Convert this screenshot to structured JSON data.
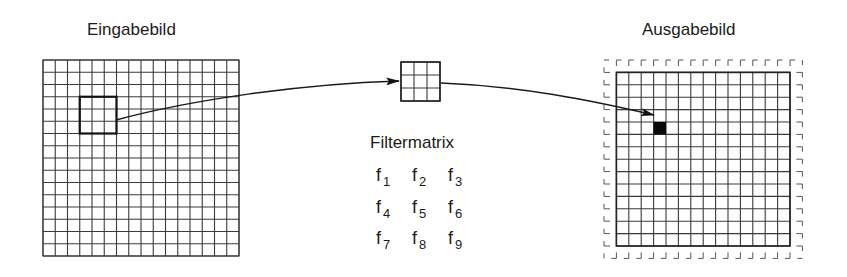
{
  "labels": {
    "input_image": "Eingabebild",
    "output_image": "Ausgabebild",
    "filter_matrix": "Filtermatrix"
  },
  "filter_coefficients": [
    [
      "f",
      "1"
    ],
    [
      "f",
      "2"
    ],
    [
      "f",
      "3"
    ],
    [
      "f",
      "4"
    ],
    [
      "f",
      "5"
    ],
    [
      "f",
      "6"
    ],
    [
      "f",
      "7"
    ],
    [
      "f",
      "8"
    ],
    [
      "f",
      "9"
    ]
  ],
  "input_grid": {
    "x": 43,
    "y": 60,
    "cols": 16,
    "rows": 16,
    "cell": 12.25,
    "highlight": {
      "col": 3,
      "row": 3,
      "size": 3
    }
  },
  "filter_box": {
    "x": 401,
    "y": 62,
    "cols": 3,
    "rows": 3,
    "cell": 13
  },
  "output_grid": {
    "frame_x": 604,
    "frame_y": 60,
    "frame_cols": 16,
    "frame_rows": 16,
    "cell": 12.4,
    "border": 1,
    "filled": {
      "col": 3,
      "row": 4
    }
  },
  "colors": {
    "line": "#3a3a3a",
    "background": "#ffffff",
    "text": "#1a1a1a"
  }
}
